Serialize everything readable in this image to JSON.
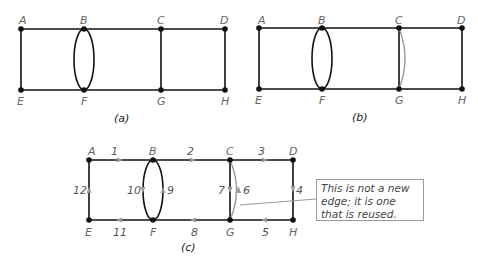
{
  "figures": [
    {
      "caption": "(a)",
      "vertices": {
        "A": "A",
        "B": "B",
        "C": "C",
        "D": "D",
        "E": "E",
        "F": "F",
        "G": "G",
        "H": "H"
      }
    },
    {
      "caption": "(b)",
      "vertices": {
        "A": "A",
        "B": "B",
        "C": "C",
        "D": "D",
        "E": "E",
        "F": "F",
        "G": "G",
        "H": "H"
      }
    },
    {
      "caption": "(c)",
      "vertices": {
        "A": "A",
        "B": "B",
        "C": "C",
        "D": "D",
        "E": "E",
        "F": "F",
        "G": "G",
        "H": "H"
      },
      "edge_order": [
        "1",
        "2",
        "3",
        "4",
        "5",
        "6",
        "7",
        "8",
        "9",
        "10",
        "11",
        "12"
      ],
      "note": "This is not a new edge; it is one that is reused."
    }
  ],
  "colors": {
    "edge": "#111111",
    "reused_edge": "#999999",
    "arrow": "#999999"
  }
}
